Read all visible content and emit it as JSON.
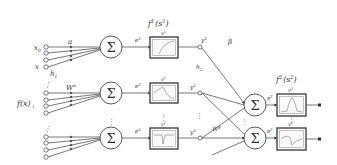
{
  "diagram": {
    "type": "neural-network",
    "inputs": {
      "x0_label": "x",
      "x0_sub": "0",
      "x_label": "x",
      "h_label": "h",
      "h_sub": "1",
      "fx_label": "f(x)",
      "fx_sub": "i",
      "a_label": "a",
      "w_label": "W",
      "w_sup": "a",
      "w_sub": "i",
      "ellipsis": "⋮"
    },
    "layer1": {
      "title": "f",
      "title_sup": "1",
      "title_arg": "(s",
      "title_arg_sup": "1",
      "title_arg_sub": "i",
      "title_close": ")",
      "sum_symbol": "Σ",
      "nodes": [
        {
          "e_label": "e",
          "e_sup": "1",
          "e_sub": "1",
          "v_label": "v",
          "v_sup": "1",
          "v_sub": "1",
          "y_label": "y",
          "y_sup": "1",
          "y_sub": "1"
        },
        {
          "e_label": "e",
          "e_sup": "1",
          "e_sub": "2",
          "v_label": "v",
          "v_sup": "1",
          "v_sub": "2",
          "y_label": "y",
          "y_sup": "1",
          "y_sub": "2"
        },
        {
          "e_label": "e",
          "e_sup": "1",
          "e_sub": "i",
          "v_label": "v",
          "v_sup": "1",
          "v_sub": "i",
          "y_label": "y",
          "y_sup": "1",
          "y_sub": "i"
        }
      ],
      "h_label": "h",
      "h_sub": "2"
    },
    "layer2": {
      "beta_label": "β",
      "title": "f",
      "title_sup": "2",
      "title_arg": "(s",
      "title_arg_sup": "2",
      "title_close": ")",
      "w_label": "W",
      "w_sup": "β",
      "w_sub": "i",
      "sum_symbol": "Σ",
      "nodes": [
        {
          "s_label": "s",
          "s_sup": "2",
          "s_sub": "1",
          "v_label": "v",
          "v_sup": "2",
          "v_sub": "1"
        },
        {
          "s_label": "s",
          "s_sup": "2",
          "s_sub": "2",
          "v_label": "v",
          "v_sup": "2",
          "v_sub": "2"
        }
      ]
    }
  }
}
